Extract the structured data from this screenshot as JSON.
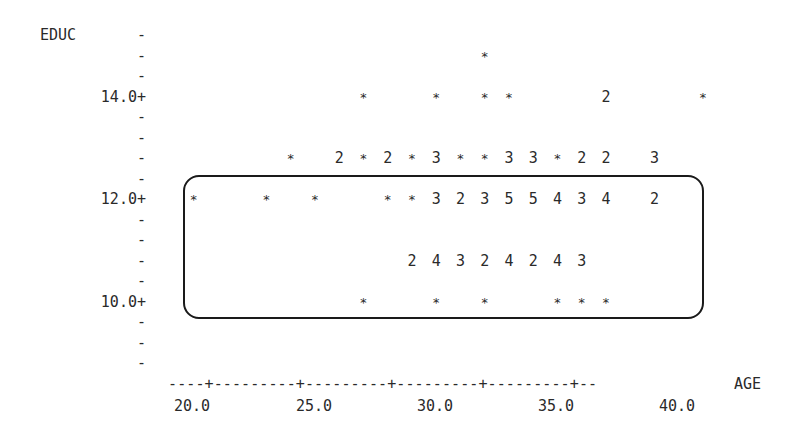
{
  "chart_data": {
    "type": "scatter",
    "title": "",
    "xlabel": "AGE",
    "ylabel": "EDUC",
    "x_ticks": [
      "20.0",
      "25.0",
      "30.0",
      "35.0",
      "40.0"
    ],
    "y_ticks": [
      "14.0+",
      "12.0+",
      "10.0+"
    ],
    "xlim": [
      18,
      41
    ],
    "ylim": [
      8.8,
      15.2
    ],
    "grid": false,
    "legend": "none; digits indicate number of overlapping observations, * indicates one",
    "annotation": "rounded rectangle enclosing points with EDUC 10.0 to 12.0",
    "points": [
      {
        "age": 31,
        "educ": 14.8,
        "mark": "*"
      },
      {
        "age": 26,
        "educ": 14.0,
        "mark": "*"
      },
      {
        "age": 29,
        "educ": 14.0,
        "mark": "*"
      },
      {
        "age": 31,
        "educ": 14.0,
        "mark": "*"
      },
      {
        "age": 32,
        "educ": 14.0,
        "mark": "*"
      },
      {
        "age": 36,
        "educ": 14.0,
        "mark": "2"
      },
      {
        "age": 40,
        "educ": 14.0,
        "mark": "*"
      },
      {
        "age": 23,
        "educ": 12.8,
        "mark": "*"
      },
      {
        "age": 25,
        "educ": 12.8,
        "mark": "2"
      },
      {
        "age": 26,
        "educ": 12.8,
        "mark": "*"
      },
      {
        "age": 27,
        "educ": 12.8,
        "mark": "2"
      },
      {
        "age": 28,
        "educ": 12.8,
        "mark": "*"
      },
      {
        "age": 29,
        "educ": 12.8,
        "mark": "3"
      },
      {
        "age": 30,
        "educ": 12.8,
        "mark": "*"
      },
      {
        "age": 31,
        "educ": 12.8,
        "mark": "*"
      },
      {
        "age": 32,
        "educ": 12.8,
        "mark": "3"
      },
      {
        "age": 33,
        "educ": 12.8,
        "mark": "3"
      },
      {
        "age": 34,
        "educ": 12.8,
        "mark": "*"
      },
      {
        "age": 35,
        "educ": 12.8,
        "mark": "2"
      },
      {
        "age": 36,
        "educ": 12.8,
        "mark": "2"
      },
      {
        "age": 38,
        "educ": 12.8,
        "mark": "3"
      },
      {
        "age": 19,
        "educ": 12.0,
        "mark": "*"
      },
      {
        "age": 22,
        "educ": 12.0,
        "mark": "*"
      },
      {
        "age": 24,
        "educ": 12.0,
        "mark": "*"
      },
      {
        "age": 27,
        "educ": 12.0,
        "mark": "*"
      },
      {
        "age": 28,
        "educ": 12.0,
        "mark": "*"
      },
      {
        "age": 29,
        "educ": 12.0,
        "mark": "3"
      },
      {
        "age": 30,
        "educ": 12.0,
        "mark": "2"
      },
      {
        "age": 31,
        "educ": 12.0,
        "mark": "3"
      },
      {
        "age": 32,
        "educ": 12.0,
        "mark": "5"
      },
      {
        "age": 33,
        "educ": 12.0,
        "mark": "5"
      },
      {
        "age": 34,
        "educ": 12.0,
        "mark": "4"
      },
      {
        "age": 35,
        "educ": 12.0,
        "mark": "3"
      },
      {
        "age": 36,
        "educ": 12.0,
        "mark": "4"
      },
      {
        "age": 38,
        "educ": 12.0,
        "mark": "2"
      },
      {
        "age": 28,
        "educ": 10.8,
        "mark": "2"
      },
      {
        "age": 29,
        "educ": 10.8,
        "mark": "4"
      },
      {
        "age": 30,
        "educ": 10.8,
        "mark": "3"
      },
      {
        "age": 31,
        "educ": 10.8,
        "mark": "2"
      },
      {
        "age": 32,
        "educ": 10.8,
        "mark": "4"
      },
      {
        "age": 33,
        "educ": 10.8,
        "mark": "2"
      },
      {
        "age": 34,
        "educ": 10.8,
        "mark": "4"
      },
      {
        "age": 35,
        "educ": 10.8,
        "mark": "3"
      },
      {
        "age": 26,
        "educ": 10.0,
        "mark": "*"
      },
      {
        "age": 29,
        "educ": 10.0,
        "mark": "*"
      },
      {
        "age": 31,
        "educ": 10.0,
        "mark": "*"
      },
      {
        "age": 34,
        "educ": 10.0,
        "mark": "*"
      },
      {
        "age": 35,
        "educ": 10.0,
        "mark": "*"
      },
      {
        "age": 36,
        "educ": 10.0,
        "mark": "*"
      }
    ]
  },
  "axis": {
    "y_title": "EDUC",
    "x_title": "AGE",
    "x_axis_line": "----+---------+---------+---------+---------+--",
    "minor_tick": "-",
    "y_labels": [
      {
        "label": "14.0+",
        "row": 3
      },
      {
        "label": "12.0+",
        "row": 8
      },
      {
        "label": "10.0+",
        "row": 13
      }
    ],
    "minor_rows": [
      0,
      1,
      2,
      4,
      5,
      6,
      7,
      9,
      10,
      11,
      12,
      14,
      15,
      16
    ],
    "x_labels": [
      {
        "label": "20.0",
        "x": 217
      },
      {
        "label": "25.0",
        "x": 339
      },
      {
        "label": "30.0",
        "x": 460
      },
      {
        "label": "35.0",
        "x": 581
      },
      {
        "label": "40.0",
        "x": 702
      }
    ]
  }
}
